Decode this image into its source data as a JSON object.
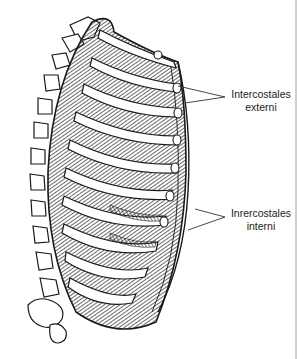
{
  "figure": {
    "labels": [
      {
        "id": "ext",
        "line1": "Intercostales",
        "line2": "externi"
      },
      {
        "id": "int",
        "line1": "Inrercostales",
        "line2": "interni"
      }
    ],
    "colors": {
      "ink": "#1a1a1a",
      "background": "#ffffff",
      "label_text": "#222222"
    }
  }
}
